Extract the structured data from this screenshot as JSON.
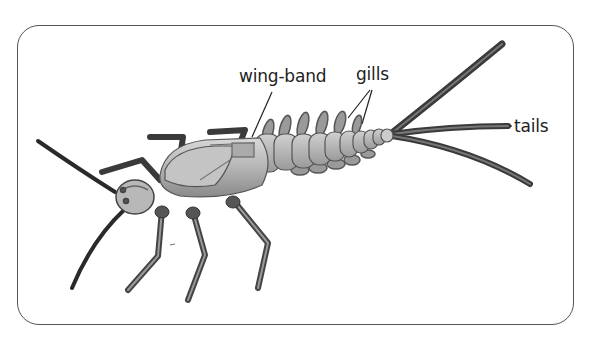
{
  "diagram": {
    "labels": {
      "wing_band": "wing-band",
      "gills": "gills",
      "tails": "tails"
    }
  }
}
